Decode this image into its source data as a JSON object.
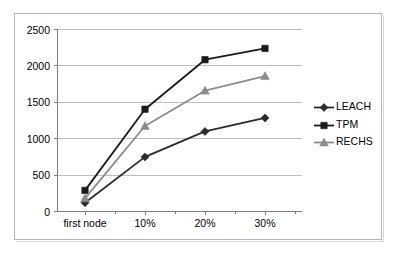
{
  "chart_data": {
    "type": "line",
    "title": "",
    "xlabel": "",
    "ylabel": "",
    "categories": [
      "first node",
      "10%",
      "20%",
      "30%"
    ],
    "ylim": [
      0,
      2500
    ],
    "ytick_labels": [
      "0",
      "500",
      "1000",
      "1500",
      "2000",
      "2500"
    ],
    "yticks": [
      0,
      500,
      1000,
      1500,
      2000,
      2500
    ],
    "grid": true,
    "legend_position": "right",
    "series": [
      {
        "name": "LEACH",
        "marker": "diamond",
        "color": "#2b2b2b",
        "values": [
          120,
          750,
          1100,
          1285
        ]
      },
      {
        "name": "TPM",
        "marker": "square",
        "color": "#1a1a1a",
        "values": [
          290,
          1405,
          2085,
          2240
        ]
      },
      {
        "name": "RECHS",
        "marker": "triangle",
        "color": "#8c8c8c",
        "values": [
          180,
          1175,
          1660,
          1860
        ]
      }
    ]
  },
  "legend": {
    "items": [
      {
        "label": "LEACH"
      },
      {
        "label": "TPM"
      },
      {
        "label": "RECHS"
      }
    ]
  },
  "axis": {
    "y_labels": [
      "2500",
      "2000",
      "1500",
      "1000",
      "500",
      "0"
    ],
    "x_labels": [
      "first node",
      "10%",
      "20%",
      "30%"
    ]
  },
  "colors": {
    "frame": "#b4b4b4",
    "gridline": "#bfbfbf",
    "axis": "#808080",
    "leach": "#2b2b2b",
    "tpm": "#1a1a1a",
    "rechs": "#8c8c8c",
    "background": "#ffffff"
  }
}
